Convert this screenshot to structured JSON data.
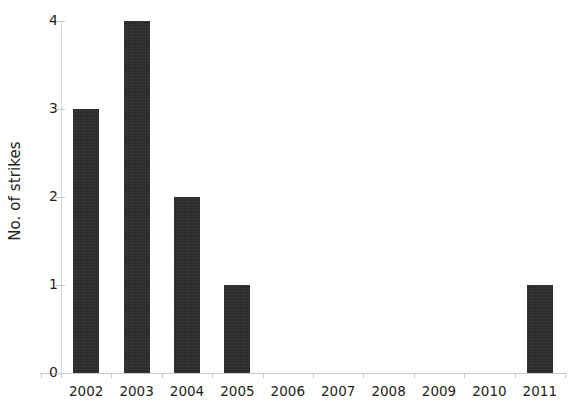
{
  "chart_data": {
    "type": "bar",
    "title": "",
    "xlabel": "",
    "ylabel": "No. of strikes",
    "categories": [
      "2002",
      "2003",
      "2004",
      "2005",
      "2006",
      "2007",
      "2008",
      "2009",
      "2010",
      "2011"
    ],
    "values": [
      3,
      4,
      2,
      1,
      0,
      0,
      0,
      0,
      0,
      1
    ],
    "ylim": [
      0,
      4
    ],
    "yticks": [
      "0",
      "1",
      "2",
      "3",
      "4"
    ],
    "ytick_values": [
      0,
      1,
      2,
      3,
      4
    ],
    "grid": false,
    "legend": null,
    "bar_color": "#2b2b2b",
    "axis_color": "#c9c9c9",
    "background_color": "#ffffff"
  }
}
